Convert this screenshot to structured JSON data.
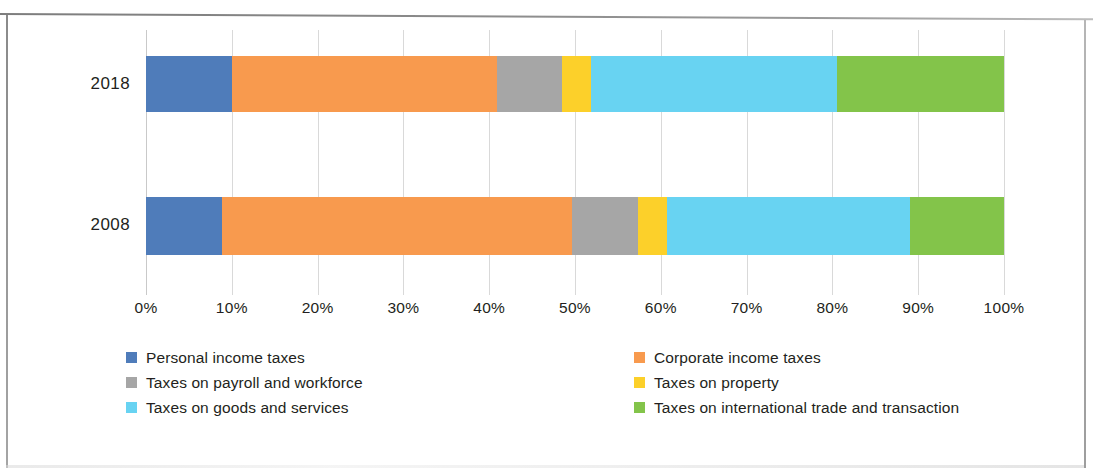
{
  "chart_data": {
    "type": "bar",
    "orientation": "horizontal",
    "stacked": true,
    "normalized": "100%",
    "title": "",
    "subtitle": "",
    "xlabel": "",
    "ylabel": "",
    "xlim": [
      0,
      100
    ],
    "xticks": [
      0,
      10,
      20,
      30,
      40,
      50,
      60,
      70,
      80,
      90,
      100
    ],
    "xticklabels": [
      "0%",
      "10%",
      "20%",
      "30%",
      "40%",
      "50%",
      "60%",
      "70%",
      "80%",
      "90%",
      "100%"
    ],
    "categories": [
      "2018",
      "2008"
    ],
    "grid": "vertical",
    "legend_position": "bottom",
    "legend_columns": 2,
    "series": [
      {
        "name": "Personal income taxes",
        "color": "#4f7cba",
        "values": [
          10.0,
          8.8
        ]
      },
      {
        "name": "Corporate income taxes",
        "color": "#f89a4e",
        "values": [
          30.9,
          40.8
        ]
      },
      {
        "name": "Taxes on payroll and workforce",
        "color": "#a6a6a6",
        "values": [
          7.6,
          7.7
        ]
      },
      {
        "name": "Taxes on property",
        "color": "#fcd02a",
        "values": [
          3.4,
          3.4
        ]
      },
      {
        "name": "Taxes on goods and services",
        "color": "#68d3f2",
        "values": [
          28.6,
          28.3
        ]
      },
      {
        "name": "Taxes on international trade and transaction",
        "color": "#83c44a",
        "values": [
          19.5,
          11.0
        ]
      }
    ]
  },
  "axis": {
    "ticks": [
      {
        "label": "0%",
        "pct": 0
      },
      {
        "label": "10%",
        "pct": 10
      },
      {
        "label": "20%",
        "pct": 20
      },
      {
        "label": "30%",
        "pct": 30
      },
      {
        "label": "40%",
        "pct": 40
      },
      {
        "label": "50%",
        "pct": 50
      },
      {
        "label": "60%",
        "pct": 60
      },
      {
        "label": "70%",
        "pct": 70
      },
      {
        "label": "80%",
        "pct": 80
      },
      {
        "label": "90%",
        "pct": 90
      },
      {
        "label": "100%",
        "pct": 100
      }
    ]
  },
  "rows": [
    {
      "label": "2018"
    },
    {
      "label": "2008"
    }
  ],
  "legend": {
    "items": [
      {
        "label": "Personal income taxes",
        "color": "#4f7cba"
      },
      {
        "label": "Corporate income taxes",
        "color": "#f89a4e"
      },
      {
        "label": "Taxes on payroll and workforce",
        "color": "#a6a6a6"
      },
      {
        "label": "Taxes on property",
        "color": "#fcd02a"
      },
      {
        "label": "Taxes on goods and services",
        "color": "#68d3f2"
      },
      {
        "label": "Taxes on international trade and transaction",
        "color": "#83c44a"
      }
    ]
  }
}
